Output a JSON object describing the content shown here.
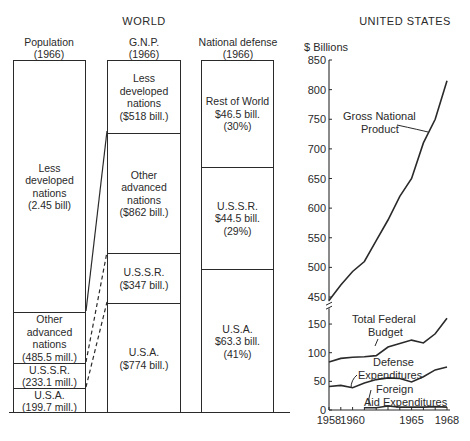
{
  "world": {
    "title": "WORLD",
    "population": {
      "header": "Population\n(1966)",
      "segments": [
        {
          "label": "Less\ndeveloped\nnations\n(2.45 bill)"
        },
        {
          "label": "Other\nadvanced\nnations\n(485.5 mill.)"
        },
        {
          "label": "U.S.S.R.\n(233.1 mill.)"
        },
        {
          "label": "U.S.A.\n(199.7 mill.)"
        }
      ]
    },
    "gnp": {
      "header": "G.N.P.\n(1966)",
      "segments": [
        {
          "label": "Less\ndeveloped\nnations\n($518 bill.)"
        },
        {
          "label": "Other\nadvanced\nnations\n($862 bill.)"
        },
        {
          "label": "U.S.S.R.\n($347 bill.)"
        },
        {
          "label": "U.S.A.\n($774 bill.)"
        }
      ]
    },
    "defense": {
      "header": "National defense\n(1966)",
      "segments": [
        {
          "label": "Rest of World\n$46.5 bill.\n(30%)"
        },
        {
          "label": "U.S.S.R.\n$44.5 bill.\n(29%)"
        },
        {
          "label": "U.S.A.\n$63.3 bill.\n(41%)"
        }
      ]
    }
  },
  "us": {
    "title": "UNITED STATES",
    "ylabel": "$ Billions"
  },
  "chart_data": [
    {
      "type": "bar",
      "title": "WORLD — Population (1966)",
      "stacked": true,
      "categories": [
        "Less developed nations",
        "Other advanced nations",
        "U.S.S.R.",
        "U.S.A."
      ],
      "values": [
        2450,
        485.5,
        233.1,
        199.7
      ],
      "unit": "millions"
    },
    {
      "type": "bar",
      "title": "WORLD — G.N.P. (1966)",
      "stacked": true,
      "categories": [
        "Less developed nations",
        "Other advanced nations",
        "U.S.S.R.",
        "U.S.A."
      ],
      "values": [
        518,
        862,
        347,
        774
      ],
      "unit": "$ billions"
    },
    {
      "type": "bar",
      "title": "WORLD — National defense (1966)",
      "stacked": true,
      "categories": [
        "Rest of World",
        "U.S.S.R.",
        "U.S.A."
      ],
      "values": [
        46.5,
        44.5,
        63.3
      ],
      "percent": [
        30,
        29,
        41
      ],
      "unit": "$ billions"
    },
    {
      "type": "line",
      "title": "UNITED STATES",
      "ylabel": "$ Billions",
      "xlabel": "",
      "x": [
        1958,
        1959,
        1960,
        1961,
        1962,
        1963,
        1964,
        1965,
        1966,
        1967,
        1968
      ],
      "xticks": [
        "1958",
        "1960",
        "1965",
        "1968"
      ],
      "upper_axis": {
        "ylim": [
          440,
          850
        ],
        "yticks": [
          450,
          500,
          550,
          600,
          650,
          700,
          750,
          800,
          850
        ]
      },
      "lower_axis": {
        "ylim": [
          0,
          170
        ],
        "yticks": [
          0,
          50,
          100,
          150
        ]
      },
      "series": [
        {
          "name": "Gross National Product",
          "axis": "upper",
          "values": [
            444,
            470,
            493,
            510,
            545,
            580,
            620,
            650,
            710,
            750,
            815
          ]
        },
        {
          "name": "Total Federal Budget",
          "axis": "lower",
          "values": [
            84,
            90,
            92,
            93,
            95,
            110,
            116,
            122,
            117,
            133,
            160,
            168
          ]
        },
        {
          "name": "Defense Expenditures",
          "axis": "lower",
          "values": [
            41,
            43,
            39,
            47,
            53,
            56,
            55,
            49,
            58,
            70,
            75
          ]
        },
        {
          "name": "Foreign Aid Expenditures",
          "axis": "lower",
          "values": [
            null,
            null,
            null,
            4,
            4,
            7,
            5,
            5,
            5,
            6,
            5
          ]
        }
      ],
      "axis_break": true
    }
  ]
}
